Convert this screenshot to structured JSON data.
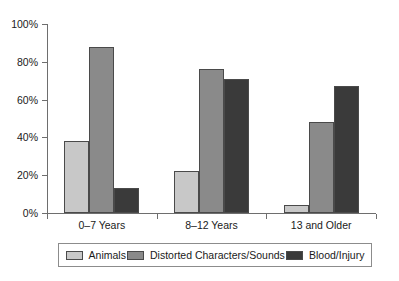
{
  "chart_data": {
    "type": "bar",
    "title": "",
    "subtitle": "",
    "xlabel": "",
    "ylabel": "",
    "categories": [
      "0–7 Years",
      "8–12 Years",
      "13 and Older"
    ],
    "series": [
      {
        "name": "Animals",
        "values": [
          38,
          22,
          4
        ],
        "color": "#c8c8c8"
      },
      {
        "name": "Distorted Characters/Sounds",
        "values": [
          88,
          76,
          48
        ],
        "color": "#8a8a8a"
      },
      {
        "name": "Blood/Injury",
        "values": [
          13,
          71,
          67
        ],
        "color": "#3a3a3a"
      }
    ],
    "ylim": [
      0,
      100
    ],
    "yticks": [
      0,
      20,
      40,
      60,
      80,
      100
    ],
    "ytick_labels": [
      "0%",
      "20%",
      "40%",
      "60%",
      "80%",
      "100%"
    ],
    "grid": false,
    "legend_position": "bottom",
    "value_format": "percent"
  },
  "axes": {
    "y_labels": [
      "100%",
      "80%",
      "60%",
      "40%",
      "20%",
      "0%"
    ]
  },
  "legend": {
    "items": [
      {
        "label": "Animals"
      },
      {
        "label": "Distorted Characters/Sounds"
      },
      {
        "label": "Blood/Injury"
      }
    ]
  }
}
